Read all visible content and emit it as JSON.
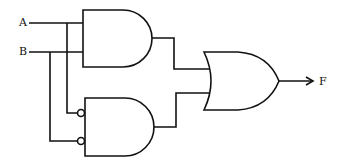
{
  "diagram": {
    "type": "logic-circuit",
    "inputs": [
      {
        "label": "A"
      },
      {
        "label": "B"
      }
    ],
    "output": {
      "label": "F"
    },
    "gates": [
      {
        "id": "and1",
        "type": "AND",
        "inputs": [
          "A",
          "B"
        ]
      },
      {
        "id": "and2",
        "type": "AND",
        "inputs": [
          "NOT A",
          "NOT B"
        ]
      },
      {
        "id": "or1",
        "type": "OR",
        "inputs": [
          "and1",
          "and2"
        ],
        "output": "F"
      }
    ],
    "line_color": "#111111"
  }
}
